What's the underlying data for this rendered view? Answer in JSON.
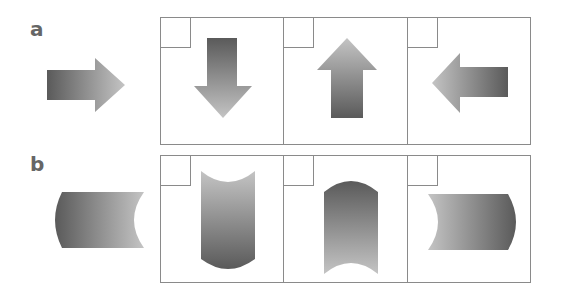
{
  "rows": [
    {
      "label": "a",
      "stimulus": "arrow-right",
      "options": [
        "arrow-down",
        "arrow-up",
        "arrow-left"
      ]
    },
    {
      "label": "b",
      "stimulus": "cylinder-horizontal-concave-right",
      "options": [
        "cylinder-vertical-concave-top",
        "cylinder-vertical-concave-bottom",
        "cylinder-horizontal-concave-left"
      ]
    }
  ],
  "colors": {
    "shape_dark": "#5a5a5a",
    "shape_light": "#c4c4c4",
    "border": "#8a8a8a",
    "label": "#666666"
  }
}
